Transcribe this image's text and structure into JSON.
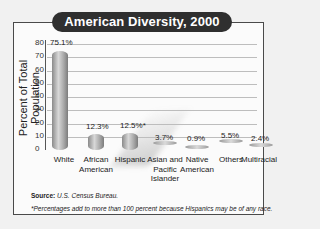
{
  "title": "American Diversity, 2000",
  "chart_data": {
    "type": "bar",
    "title": "American Diversity, 2000",
    "xlabel": "",
    "ylabel": "Percent of Total Population",
    "ylim": [
      0,
      80
    ],
    "yticks": [
      "0",
      "10",
      "20",
      "30",
      "40",
      "50",
      "60",
      "70",
      "80"
    ],
    "grid": true,
    "categories": [
      "White",
      "African American",
      "Hispanic",
      "Asian and Pacific Islander",
      "Native American",
      "Others",
      "Multiracial"
    ],
    "category_display": [
      "White",
      "African\nAmerican",
      "Hispanic",
      "Asian and\nPacific\nIslander",
      "Native\nAmerican",
      "Others",
      "Multiracial"
    ],
    "values": [
      75.1,
      12.3,
      12.5,
      3.7,
      0.9,
      5.5,
      2.4
    ],
    "value_labels": [
      "75.1%",
      "12.3%",
      "12.5%*",
      "3.7%",
      "0.9%",
      "5.5%",
      "2.4%"
    ]
  },
  "source_label": "Source:",
  "source_text": "U.S. Census Bureau.",
  "footnote": "*Percentages add to more than 100 percent because Hispanics may be of any race."
}
